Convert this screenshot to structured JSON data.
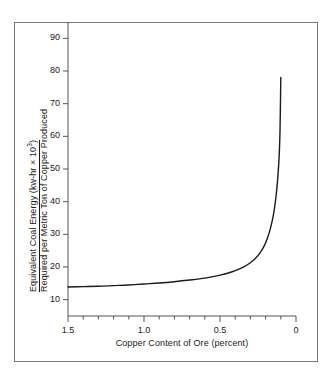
{
  "chart_data": {
    "type": "line",
    "title": "",
    "xlabel": "Copper Content of Ore (percent)",
    "ylabel_line1": "Equivalent Coal Energy (kw-hr × 10",
    "ylabel_line1_sup": "3",
    "ylabel_line1_tail": ")",
    "ylabel_line2": "Required per Metric Ton of Copper Produced",
    "xlim": [
      1.5,
      0.0
    ],
    "ylim": [
      5,
      95
    ],
    "x_reversed": true,
    "grid": false,
    "legend": null,
    "x_major_ticks": [
      1.5,
      1.0,
      0.5,
      0
    ],
    "x_major_tick_labels": [
      "1.5",
      "1.0",
      "0.5",
      "0"
    ],
    "x_minor_ticks": [
      1.4,
      1.3,
      1.2,
      1.1,
      0.9,
      0.8,
      0.7,
      0.6,
      0.4,
      0.3,
      0.2,
      0.1
    ],
    "y_ticks": [
      10,
      20,
      30,
      40,
      50,
      60,
      70,
      80,
      90
    ],
    "y_tick_labels": [
      "10",
      "20",
      "30",
      "40",
      "50",
      "60",
      "70",
      "80",
      "90"
    ],
    "series": [
      {
        "name": "Equivalent coal energy per metric ton of copper",
        "color": "#1a1a1a",
        "x": [
          1.5,
          1.4,
          1.3,
          1.2,
          1.1,
          1.0,
          0.9,
          0.8,
          0.7,
          0.6,
          0.5,
          0.45,
          0.4,
          0.35,
          0.3,
          0.27,
          0.24,
          0.21,
          0.19,
          0.17,
          0.15,
          0.14,
          0.13,
          0.12,
          0.115,
          0.11,
          0.105,
          0.1
        ],
        "y": [
          13.9,
          14.0,
          14.1,
          14.3,
          14.5,
          14.8,
          15.1,
          15.5,
          16.0,
          16.6,
          17.5,
          18.1,
          18.9,
          19.9,
          21.3,
          22.5,
          24.1,
          26.4,
          28.6,
          31.5,
          35.6,
          38.5,
          42.2,
          47.2,
          50.5,
          54.8,
          62.0,
          78.0
        ]
      }
    ]
  },
  "axes_geometry": {
    "x_pixel_left": 68,
    "x_pixel_right": 296,
    "y_pixel_top": 22,
    "y_pixel_bottom": 316
  },
  "colors": {
    "curve": "#1a1a1a",
    "axis": "#555555",
    "frame": "#777777",
    "text": "#1a1a1a",
    "background": "#ffffff"
  }
}
